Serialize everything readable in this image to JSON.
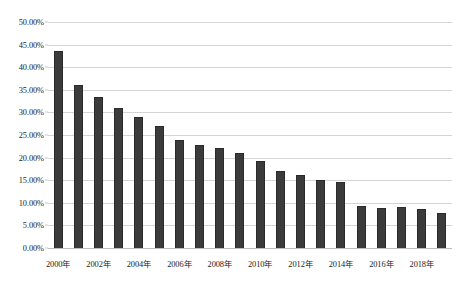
{
  "chart_data": {
    "type": "bar",
    "title": "",
    "subtitle": "",
    "xlabel": "",
    "ylabel": "",
    "ylim": [
      0,
      0.5
    ],
    "grid": true,
    "legend": false,
    "legend_position": "none",
    "bar_color": "#3b3b3b",
    "gridline_color": "#d4d4d4",
    "y_tick_labels": [
      "50.00%",
      "45.00%",
      "40.00%",
      "35.00%",
      "30.00%",
      "25.00%",
      "20.00%",
      "15.00%",
      "10.00%",
      "5.00%",
      "0.00%"
    ],
    "y_tick_values": [
      50,
      45,
      40,
      35,
      30,
      25,
      20,
      15,
      10,
      5,
      0
    ],
    "categories": [
      "2000年",
      "2001年",
      "2002年",
      "2003年",
      "2004年",
      "2005年",
      "2006年",
      "2007年",
      "2008年",
      "2009年",
      "2010年",
      "2011年",
      "2012年",
      "2013年",
      "2014年",
      "2015年",
      "2016年",
      "2017年",
      "2018年",
      "2019年"
    ],
    "x_tick_labels": [
      "2000年",
      "2002年",
      "2004年",
      "2006年",
      "2008年",
      "2010年",
      "2012年",
      "2014年",
      "2016年",
      "2018年"
    ],
    "x_tick_indices": [
      0,
      2,
      4,
      6,
      8,
      10,
      12,
      14,
      16,
      18
    ],
    "values": [
      43.5,
      36.0,
      33.4,
      30.9,
      29.0,
      27.1,
      23.8,
      22.7,
      22.1,
      21.0,
      19.3,
      17.1,
      16.2,
      15.1,
      14.6,
      9.2,
      8.9,
      9.0,
      8.6,
      7.8
    ],
    "value_labels": [
      "43.50%",
      "36.00%",
      "33.40%",
      "30.90%",
      "29.00%",
      "27.10%",
      "23.80%",
      "22.70%",
      "22.10%",
      "21.00%",
      "19.30%",
      "17.10%",
      "16.20%",
      "15.10%",
      "14.60%",
      "9.20%",
      "8.90%",
      "9.00%",
      "8.60%",
      "7.80%"
    ]
  }
}
